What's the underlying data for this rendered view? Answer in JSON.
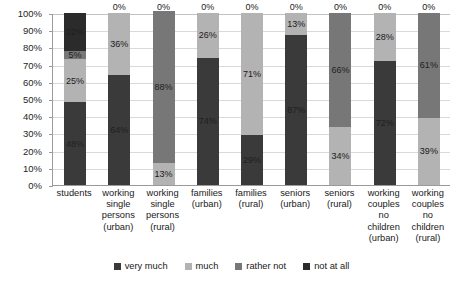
{
  "chart_data": {
    "type": "bar",
    "variant": "stacked-100-percent",
    "title": "",
    "subtitle": "",
    "xlabel": "",
    "ylabel": "",
    "ylim": [
      0,
      100
    ],
    "y_tick_labels": [
      "0%",
      "10%",
      "20%",
      "30%",
      "40%",
      "50%",
      "60%",
      "70%",
      "80%",
      "90%",
      "100%"
    ],
    "y_tick_values": [
      0,
      10,
      20,
      30,
      40,
      50,
      60,
      70,
      80,
      90,
      100
    ],
    "grid": true,
    "legend_position": "bottom",
    "categories": [
      "students",
      "working single persons (urban)",
      "working single persons (rural)",
      "families (urban)",
      "families (rural)",
      "seniors (urban)",
      "seniors (rural)",
      "working couples no children (urban)",
      "working couples no children (rural)"
    ],
    "category_lines": [
      [
        "students"
      ],
      [
        "working",
        "single",
        "persons",
        "(urban)"
      ],
      [
        "working",
        "single",
        "persons",
        "(rural)"
      ],
      [
        "families",
        "(urban)"
      ],
      [
        "families",
        "(rural)"
      ],
      [
        "seniors",
        "(urban)"
      ],
      [
        "seniors",
        "(rural)"
      ],
      [
        "working",
        "couples",
        "no",
        "children",
        "(urban)"
      ],
      [
        "working",
        "couples",
        "no",
        "children",
        "(rural)"
      ]
    ],
    "series": [
      {
        "name": "very much",
        "color": "#3a3a3a",
        "values": [
          48,
          64,
          0,
          74,
          29,
          87,
          0,
          72,
          0
        ],
        "labels": [
          "48%",
          "64%",
          "0%",
          "74%",
          "29%",
          "87%",
          "0%",
          "72%",
          "0%"
        ]
      },
      {
        "name": "much",
        "color": "#b3b3b3",
        "values": [
          25,
          36,
          13,
          26,
          71,
          13,
          34,
          28,
          39
        ],
        "labels": [
          "25%",
          "36%",
          "13%",
          "26%",
          "71%",
          "13%",
          "34%",
          "28%",
          "39%"
        ]
      },
      {
        "name": "rather not",
        "color": "#777777",
        "values": [
          5,
          0,
          88,
          0,
          0,
          0,
          66,
          0,
          61
        ],
        "labels": [
          "5%",
          "0%",
          "88%",
          "0%",
          "0%",
          "0%",
          "66%",
          "0%",
          "61%"
        ]
      },
      {
        "name": "not at all",
        "color": "#2b2b2b",
        "values": [
          22,
          0,
          0,
          0,
          0,
          0,
          0,
          0,
          0
        ],
        "labels": [
          "22%",
          "0%",
          "0%",
          "0%",
          "0%",
          "0%",
          "0%",
          "0%",
          "0%"
        ]
      }
    ]
  },
  "legend": {
    "items": [
      {
        "label": "very much",
        "color": "#3a3a3a"
      },
      {
        "label": "much",
        "color": "#b3b3b3"
      },
      {
        "label": "rather not",
        "color": "#777777"
      },
      {
        "label": "not at all",
        "color": "#2b2b2b"
      }
    ]
  }
}
